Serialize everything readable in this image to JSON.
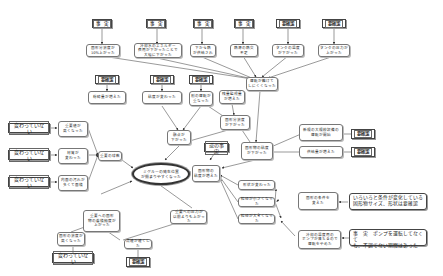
{
  "title": "",
  "center": {
    "label": "ミグルーの発生位置\nが揃まりやすくなった"
  },
  "nodes": {
    "fact1": "事　実",
    "fact2": "事　実",
    "fact3": "事　実",
    "fact4": "事　実",
    "conf1": "要確認",
    "conf2": "要確認",
    "t1": "固形分濃度が\n10%上がった",
    "t2": "冷却水のエネルギー\n費用が下がったことで\n大幅に下がった",
    "t3": "下から熱\nが供給され",
    "t4": "熱源の熱交\n不足",
    "t5": "タンクの温度\nが下がった",
    "t6": "タンクの圧力が\n上がった",
    "conf3": "要確認",
    "conf4": "要確認",
    "conf5": "要確認",
    "m1": "粉砕量が増えた",
    "m2": "粘度が変わった",
    "m3": "別の運転が\n重なった",
    "m4": "残量監視量\nが増えた",
    "m5": "運転が難けて\nしにくくなった",
    "m6": "固形分濃度\nが下がった",
    "m7": "融点が\n下がった",
    "other_fact": "逆の事実",
    "m8": "固形物の粘度\nが下がった",
    "r1": "新規の大規模設備の\n運転が開始",
    "r2": "供給量が増えた",
    "conf6": "要確認",
    "conf7": "要確認",
    "no1": "変わっていない",
    "no2": "変わっていない",
    "no3": "変わっていない",
    "no4": "変わっていない",
    "l1": "重要値が\n高くなった",
    "l2": "材質が\n変わった",
    "l3": "内面の汚れが\n多くて面積",
    "l4": "重要の球数",
    "c1": "固形物の\n粘度が増えた",
    "b1": "形状が変わった",
    "b2": "粒径が小さくなった",
    "b3": "粒径が大きくなった",
    "b4": "固形の条件を\n変えた",
    "b5": "冷却の温度用の\nポンプが落ちるので\n運転をやめた",
    "note1": "いろいろと条件が変化している\n固形物サイズ、形状は要確認",
    "note2": "事　実　ポンプを運転してなくて\nも、不調でない期間はあった",
    "d1": "重要への固形\n物の蓄積頻度が\n上がった",
    "d2": "重要への圧力が\n以前よりも上がった",
    "d3": "固形の濃度が\n高くなった",
    "d4": "流速が速くした",
    "conf8": "要確認"
  }
}
